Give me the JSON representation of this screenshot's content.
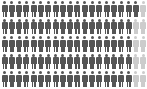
{
  "chart_data": {
    "type": "pictograph",
    "title": "",
    "rows": 5,
    "columns": 20,
    "total_icons": 100,
    "icon": "person-icon",
    "series": [
      {
        "name": "highlighted",
        "value": 91,
        "color": "#555555"
      },
      {
        "name": "remainder",
        "value": 9,
        "color": "#cccccc"
      }
    ],
    "row_counts": [
      {
        "dark": 19,
        "light": 1
      },
      {
        "dark": 18,
        "light": 2
      },
      {
        "dark": 18,
        "light": 2
      },
      {
        "dark": 18,
        "light": 2
      },
      {
        "dark": 18,
        "light": 2
      }
    ]
  }
}
